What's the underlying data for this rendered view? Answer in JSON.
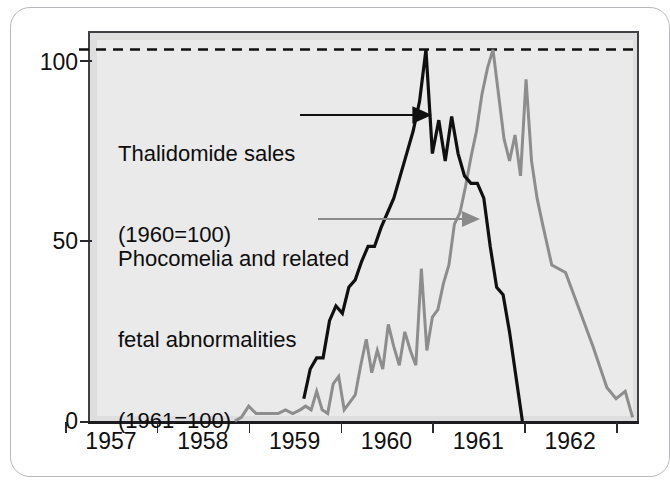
{
  "figure": {
    "frame_name": "page-border",
    "background_color": "#eaeaea",
    "axis_color": "#1d1d21"
  },
  "annotations": [
    {
      "id": "thalidomide-sales",
      "line1": "Thalidomide sales",
      "line2": "(1960=100)",
      "arrow_color": "#101010",
      "arrow_from_x": 300,
      "arrow_from_y": 115,
      "arrow_to_x": 430,
      "arrow_to_y": 115
    },
    {
      "id": "phocomelia-fetal-abnormalities",
      "line1": "Phocomelia and related",
      "line2": "fetal abnormalities",
      "line3": "(1961=100)",
      "arrow_color": "#8a8a8a",
      "arrow_from_x": 318,
      "arrow_from_y": 219,
      "arrow_to_x": 478,
      "arrow_to_y": 219
    }
  ],
  "chart_data": {
    "type": "line",
    "title": "",
    "subtitle": "",
    "xlabel": "",
    "ylabel": "",
    "xlim": [
      1956.75,
      1962.75
    ],
    "ylim": [
      0,
      105
    ],
    "grid": false,
    "legend_position": "inline-annotations",
    "y_ticks": [
      0,
      50,
      100
    ],
    "y_tick_labels": [
      "0",
      "50",
      "100"
    ],
    "x_ticks": [
      1957,
      1958,
      1959,
      1960,
      1961,
      1962
    ],
    "x_tick_labels": [
      "1957",
      "1958",
      "1959",
      "1960",
      "1961",
      "1962"
    ],
    "reference_lines": [
      {
        "name": "index-100-dashed",
        "y": 100,
        "style": "dashed",
        "color": "#101010"
      }
    ],
    "series": [
      {
        "name": "Thalidomide sales",
        "index_base": "1960=100",
        "color": "#101010",
        "width": 3.2,
        "x": [
          1959.1,
          1959.17,
          1959.24,
          1959.31,
          1959.38,
          1959.45,
          1959.52,
          1959.59,
          1959.66,
          1959.73,
          1959.8,
          1959.87,
          1959.94,
          1960.01,
          1960.08,
          1960.15,
          1960.22,
          1960.29,
          1960.36,
          1960.43,
          1960.5,
          1960.57,
          1960.64,
          1960.71,
          1960.78,
          1960.85,
          1960.92,
          1960.99,
          1961.06,
          1961.13,
          1961.2,
          1961.27,
          1961.34,
          1961.41,
          1961.48
        ],
        "y": [
          6,
          14,
          17,
          17,
          27,
          31,
          29,
          36,
          38,
          43,
          47,
          47,
          52,
          56,
          60,
          66,
          72,
          78,
          86,
          100,
          72,
          81,
          70,
          82,
          72,
          66,
          64,
          64,
          60,
          47,
          36,
          34,
          24,
          12,
          0
        ]
      },
      {
        "name": "Phocomelia and related fetal abnormalities",
        "index_base": "1961=100",
        "color": "#8d8d8d",
        "width": 3.0,
        "x": [
          1958.35,
          1958.42,
          1958.5,
          1958.58,
          1958.66,
          1958.74,
          1958.82,
          1958.9,
          1958.98,
          1959.06,
          1959.12,
          1959.18,
          1959.24,
          1959.3,
          1959.36,
          1959.42,
          1959.48,
          1959.54,
          1959.6,
          1959.66,
          1959.72,
          1959.78,
          1959.84,
          1959.9,
          1959.96,
          1960.02,
          1960.08,
          1960.14,
          1960.2,
          1960.26,
          1960.32,
          1960.38,
          1960.44,
          1960.5,
          1960.56,
          1960.62,
          1960.68,
          1960.74,
          1960.8,
          1960.86,
          1960.92,
          1960.98,
          1961.04,
          1961.1,
          1961.16,
          1961.22,
          1961.28,
          1961.34,
          1961.4,
          1961.46,
          1961.52,
          1961.58,
          1961.64,
          1961.7,
          1961.8,
          1961.95,
          1962.1,
          1962.25,
          1962.4,
          1962.5,
          1962.6,
          1962.68
        ],
        "y": [
          0,
          1,
          4,
          2,
          2,
          2,
          2,
          3,
          2,
          3,
          4,
          3,
          8,
          3,
          2,
          10,
          12,
          3,
          5,
          7,
          15,
          22,
          13,
          19,
          14,
          26,
          20,
          15,
          24,
          19,
          15,
          41,
          19,
          28,
          30,
          37,
          42,
          53,
          56,
          63,
          71,
          78,
          88,
          95,
          100,
          88,
          76,
          70,
          77,
          66,
          92,
          70,
          60,
          53,
          42,
          40,
          30,
          20,
          9,
          6,
          8,
          1
        ]
      }
    ]
  }
}
